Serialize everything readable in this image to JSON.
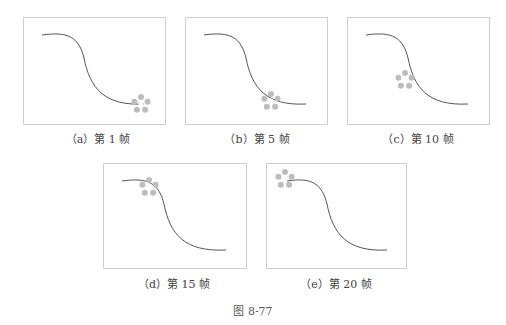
{
  "figure": {
    "label": "图 8-77",
    "panels": [
      {
        "id": "a",
        "caption": "（a）第 1 帧",
        "frame": 1,
        "flower_pos": [
          117,
          96
        ]
      },
      {
        "id": "b",
        "caption": "（b）第 5 帧",
        "frame": 5,
        "flower_pos": [
          98,
          99
        ]
      },
      {
        "id": "c",
        "caption": "（c）第 10 帧",
        "frame": 10,
        "flower_pos": [
          67,
          76
        ]
      },
      {
        "id": "d",
        "caption": "（d）第 15 帧",
        "frame": 15,
        "flower_pos": [
          48,
          26
        ]
      },
      {
        "id": "e",
        "caption": "（e）第 20 帧",
        "frame": 20,
        "flower_pos": [
          19,
          17
        ]
      }
    ]
  }
}
